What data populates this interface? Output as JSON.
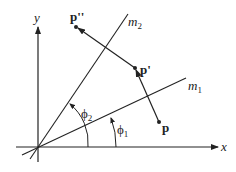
{
  "diagram": {
    "type": "reflection-composition",
    "axes": {
      "x_label": "x",
      "y_label": "y"
    },
    "lines": [
      {
        "id": "m1",
        "label": "m",
        "subscript": "1"
      },
      {
        "id": "m2",
        "label": "m",
        "subscript": "2"
      }
    ],
    "points": [
      {
        "id": "P",
        "label": "p"
      },
      {
        "id": "P1",
        "label": "p'"
      },
      {
        "id": "P2",
        "label": "p''"
      }
    ],
    "angles": [
      {
        "id": "phi1",
        "label": "ϕ",
        "subscript": "1"
      },
      {
        "id": "phi2",
        "label": "ϕ",
        "subscript": "2"
      }
    ],
    "colors": {
      "ink": "#222222",
      "background": "#ffffff"
    }
  }
}
